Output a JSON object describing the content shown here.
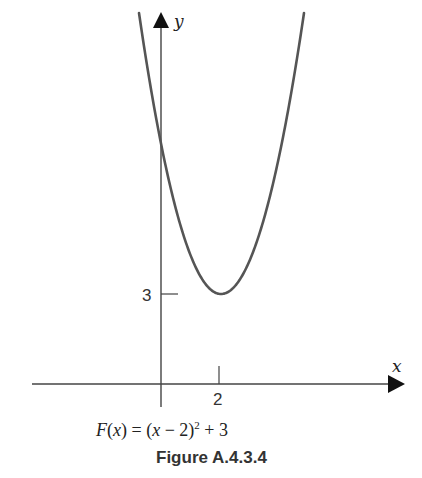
{
  "chart_data": {
    "type": "line",
    "title": "",
    "caption": "Figure A.4.3.4",
    "function_label": "F(x) = (x − 2)^2 + 3",
    "function": {
      "name": "F",
      "expression": "(x - 2)^2 + 3",
      "vertex": [
        2,
        3
      ]
    },
    "xlabel": "x",
    "ylabel": "y",
    "x_ticks": [
      {
        "value": 2,
        "label": "2"
      }
    ],
    "y_ticks": [
      {
        "value": 3,
        "label": "3"
      }
    ],
    "series": [
      {
        "name": "F(x)",
        "x": [
          -0.8,
          -0.5,
          0,
          0.5,
          1,
          1.5,
          2,
          2.5,
          3,
          3.5,
          4,
          4.5,
          4.9
        ],
        "values": [
          10.84,
          9.25,
          7,
          5.25,
          4,
          3.25,
          3,
          3.25,
          4,
          5.25,
          7,
          9.25,
          11.41
        ]
      }
    ],
    "grid": false,
    "legend": "none"
  },
  "labels": {
    "x_axis": "x",
    "y_axis": "y",
    "tick_x_2": "2",
    "tick_y_3": "3",
    "formula_F": "F",
    "formula_open": "(",
    "formula_x": "x",
    "formula_close_eq": ") = (",
    "formula_x2": "x",
    "formula_minus2": " − 2)",
    "formula_exp": "2",
    "formula_plus3": " + 3",
    "caption": "Figure A.4.3.4"
  }
}
